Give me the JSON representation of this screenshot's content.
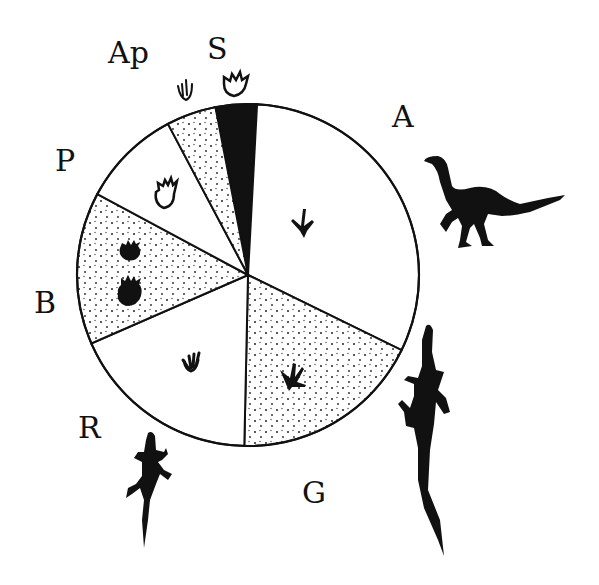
{
  "chart_data": {
    "type": "pie",
    "title": "",
    "start_angle_deg": -11,
    "direction": "clockwise",
    "slices": [
      {
        "label": "A",
        "value": 31.4,
        "fill": "white",
        "icon": "three-toed-bird-like-footprint-icon"
      },
      {
        "label": "G",
        "value": 18.1,
        "fill": "stipple",
        "icon": "webbed-footprint-icon"
      },
      {
        "label": "R",
        "value": 18.1,
        "fill": "white",
        "icon": "reptile-footprint-icon"
      },
      {
        "label": "B",
        "value": 14.4,
        "fill": "stipple",
        "icon": "paired-paw-prints-icon"
      },
      {
        "label": "P",
        "value": 9.4,
        "fill": "white",
        "icon": "clawed-footprint-outline-icon"
      },
      {
        "label": "Ap",
        "value": 4.7,
        "fill": "stipple",
        "icon": "slender-finger-print-icon"
      },
      {
        "label": "S",
        "value": 3.9,
        "fill": "black",
        "icon": "clawed-footprint-outline-icon"
      }
    ],
    "annotations": [
      {
        "near": "A",
        "icon": "theropod-dinosaur-silhouette-icon"
      },
      {
        "near": "G",
        "icon": "lizard-silhouette-large-icon"
      },
      {
        "near": "R",
        "icon": "lizard-silhouette-small-icon"
      }
    ]
  },
  "labels": {
    "A": "A",
    "G": "G",
    "R": "R",
    "B": "B",
    "P": "P",
    "Ap": "Ap",
    "S": "S"
  }
}
